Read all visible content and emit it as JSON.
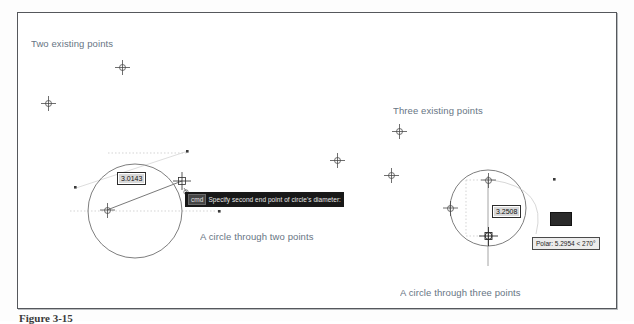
{
  "figure": {
    "caption": "Figure 3-15",
    "frame_color": "#55585c",
    "annotation_color": "#5b6b7a"
  },
  "annotations": [
    {
      "name": "two-existing-points",
      "text": "Two existing points",
      "x": 31,
      "y": 38
    },
    {
      "name": "three-existing-points",
      "text": "Three existing points",
      "x": 393,
      "y": 105
    },
    {
      "name": "circle-through-two",
      "text": "A circle through two points",
      "x": 200,
      "y": 231
    },
    {
      "name": "circle-through-three",
      "text": "A circle through three points",
      "x": 400,
      "y": 287
    }
  ],
  "points": [
    {
      "name": "point-top-left",
      "x": 122,
      "y": 67
    },
    {
      "name": "point-far-left",
      "x": 48,
      "y": 103
    },
    {
      "name": "point-middle-left",
      "x": 337,
      "y": 160
    },
    {
      "name": "point-middle-right",
      "x": 391,
      "y": 175
    },
    {
      "name": "point-upper-right",
      "x": 399,
      "y": 131
    }
  ],
  "left_drawing": {
    "name": "circle-through-two-points",
    "dimension_value": "3.0143",
    "dimension_box": {
      "x": 117,
      "y": 172
    },
    "tooltip": {
      "prompt": "Specify second end point of circle's diameter:",
      "icon": "cmd",
      "x": 185,
      "y": 192
    }
  },
  "right_drawing": {
    "name": "circle-through-three-points",
    "dimension_value": "3.2508",
    "dimension_box": {
      "x": 492,
      "y": 205
    },
    "polar_tooltip": {
      "text": "Polar: 5.2954 < 270°",
      "x": 532,
      "y": 237
    },
    "blank_tooltip": {
      "x": 550,
      "y": 212,
      "width": 20,
      "height": 12
    }
  },
  "colors": {
    "cad_line": "#6c6c6c",
    "cad_line_light": "#b4b4b4",
    "grip": "#2f2f2f",
    "tooltip_dark_bg": "#181818",
    "tooltip_polar_bg": "#ececec",
    "dim_box_bg": "#d9d9d9"
  }
}
